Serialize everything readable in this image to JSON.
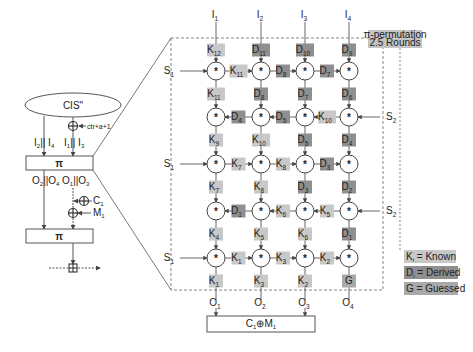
{
  "left_panel": {
    "cis_label": "CIS\"",
    "ctr_label": "ctr+a+1",
    "inputs_left": {
      "main": "I",
      "sub1": "2",
      "sep": "|| I",
      "sub2": "4"
    },
    "inputs_right": {
      "main": "I",
      "sub1": "1",
      "sep": "|| I",
      "sub2": "3"
    },
    "pi_box_1": "π",
    "outputs_left": {
      "main": "O",
      "sub1": "2",
      "sep": "||O",
      "sub2": "4"
    },
    "outputs_right": {
      "main": "O",
      "sub1": "1",
      "sep": "||O",
      "sub2": "3"
    },
    "c1": {
      "main": "C",
      "sub": "1"
    },
    "m1": {
      "main": "M",
      "sub": "1"
    },
    "pi_box_2": "π"
  },
  "right_panel": {
    "title_line1": "π-permutation",
    "title_line2": "2.5 Rounds",
    "top_inputs": [
      {
        "main": "I",
        "sub": "1"
      },
      {
        "main": "I",
        "sub": "2"
      },
      {
        "main": "I",
        "sub": "3"
      },
      {
        "main": "I",
        "sub": "4"
      }
    ],
    "bottom_outputs": [
      {
        "main": "O",
        "sub": "1"
      },
      {
        "main": "O",
        "sub": "2"
      },
      {
        "main": "O",
        "sub": "3"
      },
      {
        "main": "O",
        "sub": "4"
      }
    ],
    "side_inputs": {
      "s1": {
        "main": "S",
        "sub": "1"
      },
      "s2": {
        "main": "S",
        "sub": "2"
      }
    },
    "operator_symbol": "*",
    "output_box": {
      "c": "C",
      "c_sub": "1",
      "op": "⊕",
      "m": "M",
      "m_sub": "1"
    },
    "vertical_labels": [
      [
        {
          "t": "K",
          "s": "12",
          "k": "known"
        },
        {
          "t": "D",
          "s": "11",
          "k": "derived"
        },
        {
          "t": "D",
          "s": "10",
          "k": "derived"
        },
        {
          "t": "D",
          "s": "9",
          "k": "derived"
        }
      ],
      [
        {
          "t": "K",
          "s": "11",
          "k": "known"
        },
        {
          "t": "D",
          "s": "8",
          "k": "derived"
        },
        {
          "t": "D",
          "s": "7",
          "k": "derived"
        },
        {
          "t": "D",
          "s": "6",
          "k": "derived"
        }
      ],
      [
        {
          "t": "K",
          "s": "9",
          "k": "known"
        },
        {
          "t": "K",
          "s": "10",
          "k": "known"
        },
        {
          "t": "D",
          "s": "5",
          "k": "derived"
        },
        {
          "t": "D",
          "s": "4",
          "k": "derived"
        }
      ],
      [
        {
          "t": "K",
          "s": "7",
          "k": "known"
        },
        {
          "t": "K",
          "s": "8",
          "k": "known"
        },
        {
          "t": "D",
          "s": "3",
          "k": "derived"
        },
        {
          "t": "D",
          "s": "2",
          "k": "derived"
        }
      ],
      [
        {
          "t": "K",
          "s": "4",
          "k": "known"
        },
        {
          "t": "K",
          "s": "5",
          "k": "known"
        },
        {
          "t": "K",
          "s": "6",
          "k": "known"
        },
        {
          "t": "D",
          "s": "1",
          "k": "derived"
        }
      ],
      [
        {
          "t": "K",
          "s": "1",
          "k": "known"
        },
        {
          "t": "K",
          "s": "3",
          "k": "known"
        },
        {
          "t": "K",
          "s": "2",
          "k": "known"
        },
        {
          "t": "G",
          "s": "",
          "k": "guessed"
        }
      ]
    ],
    "horizontal_labels": [
      [
        {
          "t": "K",
          "s": "11",
          "k": "known"
        },
        {
          "t": "D",
          "s": "8",
          "k": "derived"
        },
        {
          "t": "D",
          "s": "7",
          "k": "derived"
        }
      ],
      [
        {
          "t": "K",
          "s": "10",
          "k": "known"
        },
        {
          "t": "D",
          "s": "5",
          "k": "derived"
        },
        {
          "t": "D",
          "s": "4",
          "k": "derived"
        }
      ],
      [
        {
          "t": "K",
          "s": "7",
          "k": "known"
        },
        {
          "t": "K",
          "s": "8",
          "k": "known"
        },
        {
          "t": "D",
          "s": "3",
          "k": "derived"
        }
      ],
      [
        {
          "t": "K",
          "s": "5",
          "k": "known"
        },
        {
          "t": "K",
          "s": "6",
          "k": "known"
        },
        {
          "t": "D",
          "s": "1",
          "k": "derived"
        }
      ],
      [
        {
          "t": "K",
          "s": "1",
          "k": "known"
        },
        {
          "t": "K",
          "s": "3",
          "k": "known"
        },
        {
          "t": "K",
          "s": "2",
          "k": "known"
        }
      ]
    ]
  },
  "legend": [
    {
      "symbol": "K",
      "sub": "i",
      "text": " = Known",
      "kind": "known"
    },
    {
      "symbol": "D",
      "sub": "i",
      "text": " = Derived",
      "kind": "derived"
    },
    {
      "symbol": "G",
      "sub": "",
      "text": " = Guessed",
      "kind": "guessed"
    }
  ],
  "colors": {
    "known": "#c8c8c8",
    "derived": "#8f8f8f",
    "guessed": "#a9a9a9",
    "title_box": "#c4c4c4",
    "line": "#555555",
    "dash": "#777777"
  }
}
